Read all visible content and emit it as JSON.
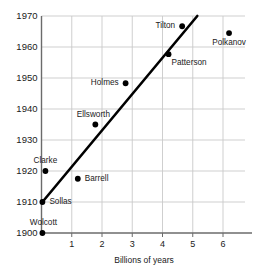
{
  "chart_data": {
    "type": "scatter",
    "title": "",
    "subtitle": "",
    "xlabel": "Billions of years",
    "ylabel": "",
    "xlim": [
      0,
      6.75
    ],
    "ylim": [
      1900,
      1970
    ],
    "xticks": [
      1,
      2,
      3,
      4,
      5,
      6
    ],
    "yticks": [
      1900,
      1910,
      1920,
      1930,
      1940,
      1950,
      1960,
      1970
    ],
    "grid": true,
    "legend": "none",
    "point_color": "#000000",
    "line_color": "#000000",
    "grid_color": "#c9c9c9",
    "axis_color": "#6b6b6b",
    "points": [
      {
        "label": "Wolcott",
        "x": 0.03,
        "y": 1900,
        "label_pos": "above-right"
      },
      {
        "label": "Sollas",
        "x": 0.03,
        "y": 1910,
        "label_pos": "right"
      },
      {
        "label": "Clarke",
        "x": 0.13,
        "y": 1920,
        "label_pos": "above"
      },
      {
        "label": "Barrell",
        "x": 1.2,
        "y": 1917.5,
        "label_pos": "right"
      },
      {
        "label": "Ellsworth",
        "x": 1.78,
        "y": 1935,
        "label_pos": "above-left"
      },
      {
        "label": "Holmes",
        "x": 2.78,
        "y": 1948.3,
        "label_pos": "left"
      },
      {
        "label": "Patterson",
        "x": 4.2,
        "y": 1957.7,
        "label_pos": "below-right"
      },
      {
        "label": "Tilton",
        "x": 4.65,
        "y": 1966.7,
        "label_pos": "left"
      },
      {
        "label": "Polkanov",
        "x": 6.2,
        "y": 1964.5,
        "label_pos": "below"
      }
    ],
    "trend_line": {
      "x1": 0.03,
      "y1": 1910,
      "x2": 5.15,
      "y2": 1970
    }
  }
}
